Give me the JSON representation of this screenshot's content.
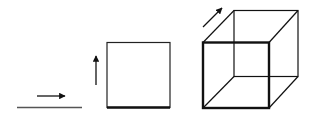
{
  "diagram": {
    "colors": {
      "stroke": "#111111",
      "segment": "#555555",
      "background": "#ffffff"
    },
    "stages": [
      {
        "name": "line-segment",
        "dimension": 1,
        "arrow_direction": "right"
      },
      {
        "name": "square",
        "dimension": 2,
        "arrow_direction": "up"
      },
      {
        "name": "cube",
        "dimension": 3,
        "arrow_direction": "diagonal-up-right"
      }
    ]
  }
}
